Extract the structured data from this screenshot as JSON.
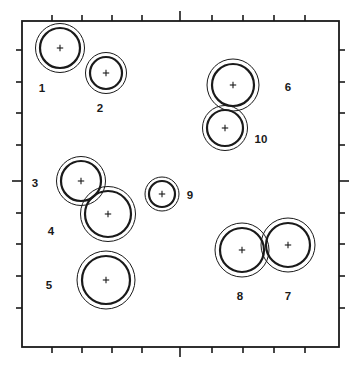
{
  "figure": {
    "title": "",
    "background_color": "#ffffff",
    "stroke_color": "#1a1a1a",
    "frame": {
      "x": 22,
      "y": 21,
      "width": 317,
      "height": 326,
      "line_width": 1.8
    },
    "axes": {
      "tick_color": "#1a1a1a",
      "tick_length_minor": 6,
      "tick_length_major": 10,
      "top_ticks_x": [
        52,
        82,
        112,
        142,
        180,
        212,
        243,
        274,
        305
      ],
      "top_major_index": 4,
      "bottom_ticks_x": [
        52,
        82,
        112,
        142,
        180,
        212,
        243,
        274,
        305
      ],
      "bottom_major_index": 4,
      "left_ticks_y": [
        50,
        82,
        113,
        145,
        181,
        213,
        244,
        276,
        308
      ],
      "left_major_index": 4,
      "right_ticks_y": [
        50,
        82,
        113,
        145,
        181,
        213,
        244,
        276,
        308
      ],
      "right_major_index": 4
    }
  },
  "chart_data": {
    "type": "scatter",
    "title": "",
    "xlabel": "",
    "ylabel": "",
    "grid": false,
    "legend": "none",
    "marker": "plus",
    "xlim": [
      0,
      353
    ],
    "ylim": [
      0,
      366
    ],
    "points": [
      {
        "id": "1",
        "label": "1",
        "cx": 60,
        "cy": 48,
        "r_inner": 20,
        "r_outer": 24.5,
        "label_x": 42,
        "label_y": 92
      },
      {
        "id": "2",
        "label": "2",
        "cx": 106,
        "cy": 73,
        "r_inner": 16,
        "r_outer": 20.5,
        "label_x": 100,
        "label_y": 112
      },
      {
        "id": "3",
        "label": "3",
        "cx": 81,
        "cy": 181,
        "r_inner": 20,
        "r_outer": 24.5,
        "label_x": 35,
        "label_y": 187
      },
      {
        "id": "4",
        "label": "4",
        "cx": 108,
        "cy": 214,
        "r_inner": 23,
        "r_outer": 27.5,
        "label_x": 51,
        "label_y": 235
      },
      {
        "id": "5",
        "label": "5",
        "cx": 106,
        "cy": 280,
        "r_inner": 24,
        "r_outer": 29,
        "label_x": 49,
        "label_y": 289
      },
      {
        "id": "6",
        "label": "6",
        "cx": 233,
        "cy": 85,
        "r_inner": 21,
        "r_outer": 26,
        "label_x": 288,
        "label_y": 91
      },
      {
        "id": "7",
        "label": "7",
        "cx": 288,
        "cy": 245,
        "r_inner": 22,
        "r_outer": 27,
        "label_x": 288,
        "label_y": 300
      },
      {
        "id": "8",
        "label": "8",
        "cx": 242,
        "cy": 250,
        "r_inner": 22,
        "r_outer": 27,
        "label_x": 240,
        "label_y": 300
      },
      {
        "id": "9",
        "label": "9",
        "cx": 162,
        "cy": 194,
        "r_inner": 13,
        "r_outer": 17,
        "label_x": 190,
        "label_y": 199
      },
      {
        "id": "10",
        "label": "10",
        "cx": 225,
        "cy": 128,
        "r_inner": 18,
        "r_outer": 22.5,
        "label_x": 261,
        "label_y": 143
      }
    ]
  }
}
